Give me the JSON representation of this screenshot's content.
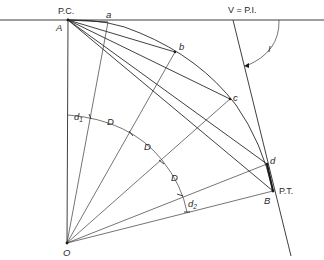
{
  "diagram": {
    "type": "circular curve layout by deflection angles (chords and radii)",
    "labels": {
      "pc": "P.C.",
      "pt": "P.T.",
      "pi": "V = P.I.",
      "point_A": "A",
      "point_B": "B",
      "point_O": "O",
      "point_a": "a",
      "point_b": "b",
      "point_c": "c",
      "point_d": "d",
      "angle_I": "I",
      "arc_d1": "d",
      "arc_d1_sub": "1",
      "arc_d2": "d",
      "arc_d2_sub": "2",
      "arc_D1": "D",
      "arc_D2": "D",
      "arc_D3": "D"
    },
    "points": {
      "A": [
        68,
        20
      ],
      "O": [
        67,
        243
      ],
      "a": [
        108,
        22
      ],
      "b": [
        175,
        52
      ],
      "c": [
        230,
        99
      ],
      "d": [
        267,
        164
      ],
      "B": [
        273,
        191
      ],
      "V": [
        233,
        20
      ]
    },
    "colors": {
      "line": "#2a2a2a",
      "background": "#ffffff"
    }
  }
}
